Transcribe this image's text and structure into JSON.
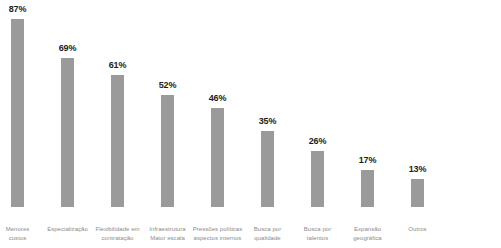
{
  "chart_data": {
    "type": "bar",
    "title": "",
    "subtitle": "",
    "xlabel": "",
    "ylabel": "",
    "ylim": [
      0,
      100
    ],
    "grid": false,
    "legend": null,
    "orientation": "vertical",
    "value_suffix": "%",
    "bar_color": "#9a9a9a",
    "value_label_color": "#1c1c1c",
    "axis_label_color": "#8b8b8b",
    "background_color": "#ffffff",
    "categories": [
      "Menores custos",
      "Especialização",
      "Flexibilidade em contratação",
      "Infraestrutura Maior escala",
      "Pressões políticas aspectos internos",
      "Busca por qualidade",
      "Busca por talentos",
      "Expansão geográfica",
      "Outros"
    ],
    "values": [
      87,
      69,
      61,
      52,
      46,
      35,
      26,
      17,
      13
    ],
    "bars": [
      {
        "category_line1": "Menores",
        "category_line2": "custos",
        "value": 87,
        "value_label": "87%"
      },
      {
        "category_line1": "Especialização",
        "category_line2": "",
        "value": 69,
        "value_label": "69%"
      },
      {
        "category_line1": "Flexibilidade em",
        "category_line2": "contratação",
        "value": 61,
        "value_label": "61%"
      },
      {
        "category_line1": "Infraestrutura",
        "category_line2": "Maior escala",
        "value": 52,
        "value_label": "52%"
      },
      {
        "category_line1": "Pressões políticas",
        "category_line2": "aspectos internos",
        "value": 46,
        "value_label": "46%"
      },
      {
        "category_line1": "Busca por",
        "category_line2": "qualidade",
        "value": 35,
        "value_label": "35%"
      },
      {
        "category_line1": "Busca por",
        "category_line2": "talentos",
        "value": 26,
        "value_label": "26%"
      },
      {
        "category_line1": "Expansão",
        "category_line2": "geográfica",
        "value": 17,
        "value_label": "17%"
      },
      {
        "category_line1": "Outros",
        "category_line2": "",
        "value": 13,
        "value_label": "13%"
      }
    ]
  }
}
